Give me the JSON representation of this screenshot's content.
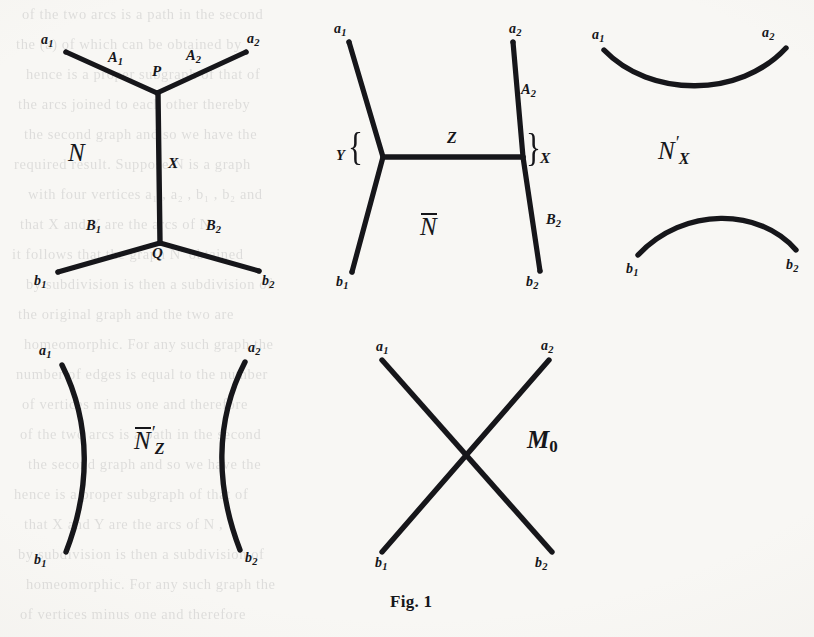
{
  "figure": {
    "caption": "Fig. 1",
    "ink_color": "#16161a",
    "paper_color": "#f8f7f4",
    "diagrams": [
      {
        "id": "N",
        "name": "graph-N",
        "label": "N",
        "label_style": "italic",
        "description": "H-shaped graph with upper junction P and lower junction Q",
        "terminals": [
          "a1",
          "a2",
          "b1",
          "b2"
        ],
        "junctions": [
          "P",
          "Q"
        ],
        "edges": [
          "A1",
          "A2",
          "X",
          "B1",
          "B2"
        ]
      },
      {
        "id": "Nbar",
        "name": "graph-N-bar",
        "label": "N",
        "label_style": "overline-italic",
        "description": "Rotated H-shaped graph with horizontal middle edge Z",
        "terminals": [
          "a1",
          "a2",
          "b1",
          "b2"
        ],
        "edges": [
          "A2",
          "B2",
          "Z"
        ],
        "braces": [
          "Y",
          "X"
        ]
      },
      {
        "id": "NprimeX",
        "name": "graph-N-prime-X",
        "label": "N",
        "label_style": "prime-sub",
        "prime": "′",
        "subscript": "X",
        "description": "Two disjoint arcs: a1-a2 concave up, b1-b2 concave down",
        "terminals": [
          "a1",
          "a2",
          "b1",
          "b2"
        ]
      },
      {
        "id": "NbarPrimeZ",
        "name": "graph-N-bar-prime-Z",
        "label": "N",
        "label_style": "overline-prime-sub",
        "prime": "′",
        "subscript": "Z",
        "description": "Two disjoint vertical arcs: a1-b1 and a2-b2",
        "terminals": [
          "a1",
          "a2",
          "b1",
          "b2"
        ]
      },
      {
        "id": "M0",
        "name": "graph-M0",
        "label": "M",
        "label_style": "bold-italic-sub",
        "subscript": "0",
        "description": "Two crossing straight segments a1-b2 and a2-b1",
        "terminals": [
          "a1",
          "a2",
          "b1",
          "b2"
        ]
      }
    ],
    "terminal_labels": {
      "a1": {
        "base": "a",
        "sub": "1"
      },
      "a2": {
        "base": "a",
        "sub": "2"
      },
      "b1": {
        "base": "b",
        "sub": "1"
      },
      "b2": {
        "base": "b",
        "sub": "2"
      }
    },
    "edge_labels": {
      "A1": {
        "base": "A",
        "sub": "1"
      },
      "A2": {
        "base": "A",
        "sub": "2"
      },
      "B1": {
        "base": "B",
        "sub": "1"
      },
      "B2": {
        "base": "B",
        "sub": "2"
      },
      "X": "X",
      "Y": "Y",
      "Z": "Z"
    },
    "point_labels": {
      "P": "P",
      "Q": "Q"
    }
  },
  "background_text": {
    "note": "faint bleed-through text from reverse of page",
    "lines": [
      "of  the  two  arcs   is   a  path    in   the  second",
      "the   (a) of   which    can   be   obtained   by",
      "hence  is  a   proper   subgraph   of   that   of",
      "the   arcs    joined   to    each   other   thereby",
      "the   second   graph    and    so    we    have    the",
      "required   result.     Suppose    N    is    a    graph",
      "with    four    vertices     a₁ ,   a₂ ,   b₁ ,   b₂    and",
      "that    X    and    Y    are    the    arcs    of    N  ,",
      "it   follows    that    the    graph     N′    obtained",
      "by   subdivision    is    then    a    subdivision    of",
      "the    original    graph    and    the    two    are",
      "homeomorphic.     For    any    such    graph    the",
      "number    of    edges    is    equal   to    the    number",
      "of     vertices     minus     one    and    therefore"
    ]
  }
}
